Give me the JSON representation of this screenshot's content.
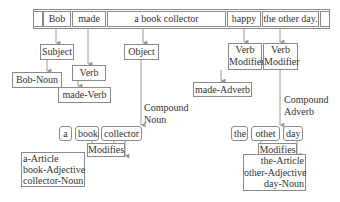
{
  "sentence": {
    "segments": [
      "",
      "Bob",
      "made",
      "a book collector",
      "happy",
      "the other day.",
      ""
    ]
  },
  "nodes": {
    "subject": "Subject",
    "verb": "Verb",
    "object": "Object",
    "verb_modifier_1": "Verb\nModifier",
    "verb_modifier_2": "Verb\nModifier",
    "bob_noun": "Bob-Noun",
    "made_verb": "made-Verb",
    "made_adverb": "made-Adverb"
  },
  "edge_labels": {
    "compound_noun": "Compound\nNoun",
    "compound_adverb": "Compound\nAdverb",
    "modifies_left": "Modifies",
    "modifies_right": "Modifies"
  },
  "compound_noun_words": [
    "a",
    "book",
    "collector"
  ],
  "compound_adverb_words": [
    "the",
    "othet",
    "day"
  ],
  "pos_left": "a-Article\nbook-Adjective\ncollector-Noun",
  "pos_right": "the-Article\nother-Adjective\nday-Noun",
  "colors": {
    "border": "#8a8a8a",
    "line": "#9a9a9a",
    "text": "#333333"
  }
}
